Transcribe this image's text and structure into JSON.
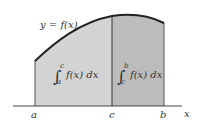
{
  "diagram": {
    "curve_label": "y = f(x)",
    "left_integral": {
      "lower": "a",
      "upper": "c",
      "integrand": "f(x) dx"
    },
    "right_integral": {
      "lower": "c",
      "upper": "b",
      "integrand": "f(x) dx"
    },
    "axis_labels": {
      "a": "a",
      "c": "c",
      "b": "b",
      "x": "x"
    },
    "colors": {
      "left_region": "#d3d3d3",
      "right_region": "#bcbcbc",
      "curve": "#222222",
      "axis": "#444444",
      "divider": "#333333"
    }
  }
}
